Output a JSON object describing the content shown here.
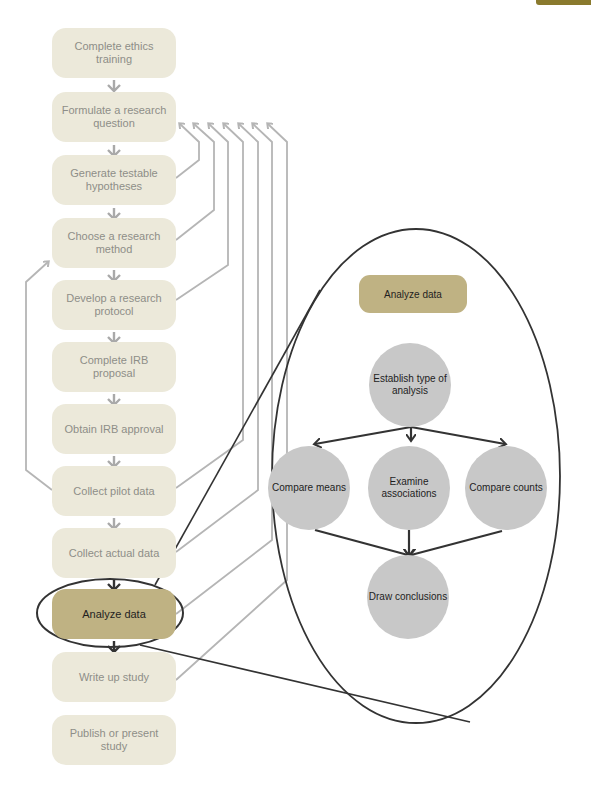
{
  "colors": {
    "step_bg": "#ece9da",
    "step_text": "#8e8e88",
    "active_bg": "#bfb283",
    "active_text": "#1f1f1f",
    "circle_bg": "#c8c8c8",
    "gray_arrow": "#b5b5b5",
    "dark_line": "#333333",
    "corner_tab": "#8a7a2e"
  },
  "flow": {
    "steps": [
      {
        "label": "Complete ethics training"
      },
      {
        "label": "Formulate a research question"
      },
      {
        "label": "Generate testable hypotheses"
      },
      {
        "label": "Choose a research method"
      },
      {
        "label": "Develop a research protocol"
      },
      {
        "label": "Complete IRB proposal"
      },
      {
        "label": "Obtain IRB approval"
      },
      {
        "label": "Collect pilot data"
      },
      {
        "label": "Collect actual data"
      },
      {
        "label": "Analyze data",
        "highlighted": true
      },
      {
        "label": "Write up study"
      },
      {
        "label": "Publish or present study"
      }
    ],
    "feedback_to": "Formulate a research question",
    "feedback_sources": [
      "Generate testable hypotheses",
      "Choose a research method",
      "Develop a research protocol",
      "Collect pilot data",
      "Collect actual data",
      "Analyze data",
      "Write up study"
    ],
    "pilot_loop": {
      "from": "Collect pilot data",
      "to": "Develop a research protocol"
    }
  },
  "callout": {
    "title": "Analyze data",
    "nodes": {
      "establish": "Establish type of analysis",
      "means": "Compare means",
      "associations": "Examine associations",
      "counts": "Compare counts",
      "conclusions": "Draw conclusions"
    }
  }
}
